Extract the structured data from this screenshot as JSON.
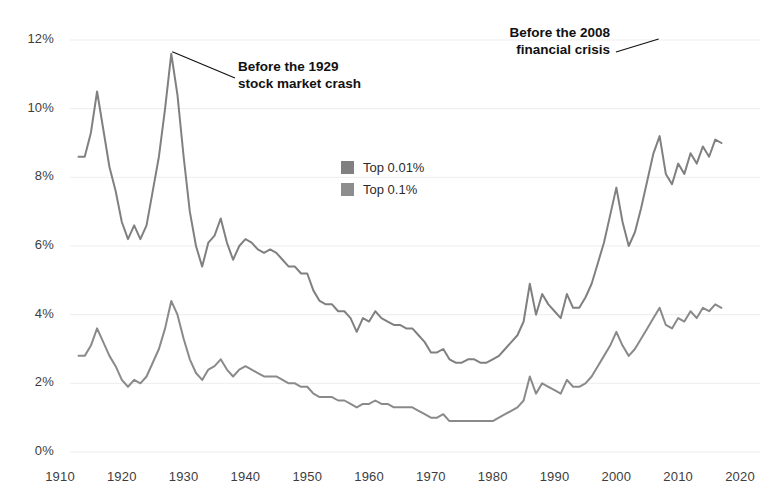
{
  "chart_data": {
    "type": "line",
    "title": "",
    "subtitle": "",
    "xlabel": "",
    "ylabel": "",
    "xlim": [
      1910,
      2020
    ],
    "ylim": [
      0,
      12
    ],
    "grid": true,
    "y_tick_labels": [
      "0%",
      "2%",
      "4%",
      "6%",
      "8%",
      "10%",
      "12%"
    ],
    "y_tick_values": [
      0,
      2,
      4,
      6,
      8,
      10,
      12
    ],
    "x_tick_labels": [
      "1910",
      "1920",
      "1930",
      "1940",
      "1950",
      "1960",
      "1970",
      "1980",
      "1990",
      "2000",
      "2010",
      "2020"
    ],
    "x_tick_values": [
      1910,
      1920,
      1930,
      1940,
      1950,
      1960,
      1970,
      1980,
      1990,
      2000,
      2010,
      2020
    ],
    "legend_position": "center",
    "legend": [
      "Top 0.01%",
      "Top 0.1%"
    ],
    "series": [
      {
        "name": "Top 0.01%",
        "color": "#808080",
        "x": [
          1913,
          1914,
          1915,
          1916,
          1917,
          1918,
          1919,
          1920,
          1921,
          1922,
          1923,
          1924,
          1925,
          1926,
          1927,
          1928,
          1929,
          1930,
          1931,
          1932,
          1933,
          1934,
          1935,
          1936,
          1937,
          1938,
          1939,
          1940,
          1941,
          1942,
          1943,
          1944,
          1945,
          1946,
          1947,
          1948,
          1949,
          1950,
          1951,
          1952,
          1953,
          1954,
          1955,
          1956,
          1957,
          1958,
          1959,
          1960,
          1961,
          1962,
          1963,
          1964,
          1965,
          1966,
          1967,
          1968,
          1969,
          1970,
          1971,
          1972,
          1973,
          1974,
          1975,
          1976,
          1977,
          1978,
          1979,
          1980,
          1981,
          1982,
          1983,
          1984,
          1985,
          1986,
          1987,
          1988,
          1989,
          1990,
          1991,
          1992,
          1993,
          1994,
          1995,
          1996,
          1997,
          1998,
          1999,
          2000,
          2001,
          2002,
          2003,
          2004,
          2005,
          2006,
          2007,
          2008,
          2009,
          2010,
          2011,
          2012,
          2013,
          2014,
          2015,
          2016,
          2017
        ],
        "values": [
          8.6,
          8.6,
          9.3,
          10.5,
          9.4,
          8.3,
          7.6,
          6.7,
          6.2,
          6.6,
          6.2,
          6.6,
          7.6,
          8.6,
          10.0,
          11.6,
          10.4,
          8.6,
          7.0,
          6.0,
          5.4,
          6.1,
          6.3,
          6.8,
          6.1,
          5.6,
          6.0,
          6.2,
          6.1,
          5.9,
          5.8,
          5.9,
          5.8,
          5.6,
          5.4,
          5.4,
          5.2,
          5.2,
          4.7,
          4.4,
          4.3,
          4.3,
          4.1,
          4.1,
          3.9,
          3.5,
          3.9,
          3.8,
          4.1,
          3.9,
          3.8,
          3.7,
          3.7,
          3.6,
          3.6,
          3.4,
          3.2,
          2.9,
          2.9,
          3.0,
          2.7,
          2.6,
          2.6,
          2.7,
          2.7,
          2.6,
          2.6,
          2.7,
          2.8,
          3.0,
          3.2,
          3.4,
          3.8,
          4.9,
          4.0,
          4.6,
          4.3,
          4.1,
          3.9,
          4.6,
          4.2,
          4.2,
          4.5,
          4.9,
          5.5,
          6.1,
          6.9,
          7.7,
          6.7,
          6.0,
          6.4,
          7.1,
          7.9,
          8.7,
          9.2,
          8.1,
          7.8,
          8.4,
          8.1,
          8.7,
          8.4,
          8.9,
          8.6,
          9.1,
          9.0
        ],
        "annotated_peaks": [
          {
            "year": 1916,
            "value": 10.5
          },
          {
            "year": 1928,
            "value": 11.6,
            "label": "Before the 1929 stock market crash"
          },
          {
            "year": 1986,
            "value": 4.9
          },
          {
            "year": 2000,
            "value": 7.7
          },
          {
            "year": 2007,
            "value": 9.2,
            "label": "Before the 2008 financial crisis"
          }
        ]
      },
      {
        "name": "Top 0.1%",
        "color": "#8a8a8a",
        "x": [
          1913,
          1914,
          1915,
          1916,
          1917,
          1918,
          1919,
          1920,
          1921,
          1922,
          1923,
          1924,
          1925,
          1926,
          1927,
          1928,
          1929,
          1930,
          1931,
          1932,
          1933,
          1934,
          1935,
          1936,
          1937,
          1938,
          1939,
          1940,
          1941,
          1942,
          1943,
          1944,
          1945,
          1946,
          1947,
          1948,
          1949,
          1950,
          1951,
          1952,
          1953,
          1954,
          1955,
          1956,
          1957,
          1958,
          1959,
          1960,
          1961,
          1962,
          1963,
          1964,
          1965,
          1966,
          1967,
          1968,
          1969,
          1970,
          1971,
          1972,
          1973,
          1974,
          1975,
          1976,
          1977,
          1978,
          1979,
          1980,
          1981,
          1982,
          1983,
          1984,
          1985,
          1986,
          1987,
          1988,
          1989,
          1990,
          1991,
          1992,
          1993,
          1994,
          1995,
          1996,
          1997,
          1998,
          1999,
          2000,
          2001,
          2002,
          2003,
          2004,
          2005,
          2006,
          2007,
          2008,
          2009,
          2010,
          2011,
          2012,
          2013,
          2014,
          2015,
          2016,
          2017
        ],
        "values": [
          2.8,
          2.8,
          3.1,
          3.6,
          3.2,
          2.8,
          2.5,
          2.1,
          1.9,
          2.1,
          2.0,
          2.2,
          2.6,
          3.0,
          3.6,
          4.4,
          4.0,
          3.3,
          2.7,
          2.3,
          2.1,
          2.4,
          2.5,
          2.7,
          2.4,
          2.2,
          2.4,
          2.5,
          2.4,
          2.3,
          2.2,
          2.2,
          2.2,
          2.1,
          2.0,
          2.0,
          1.9,
          1.9,
          1.7,
          1.6,
          1.6,
          1.6,
          1.5,
          1.5,
          1.4,
          1.3,
          1.4,
          1.4,
          1.5,
          1.4,
          1.4,
          1.3,
          1.3,
          1.3,
          1.3,
          1.2,
          1.1,
          1.0,
          1.0,
          1.1,
          0.9,
          0.9,
          0.9,
          0.9,
          0.9,
          0.9,
          0.9,
          0.9,
          1.0,
          1.1,
          1.2,
          1.3,
          1.5,
          2.2,
          1.7,
          2.0,
          1.9,
          1.8,
          1.7,
          2.1,
          1.9,
          1.9,
          2.0,
          2.2,
          2.5,
          2.8,
          3.1,
          3.5,
          3.1,
          2.8,
          3.0,
          3.3,
          3.6,
          3.9,
          4.2,
          3.7,
          3.6,
          3.9,
          3.8,
          4.1,
          3.9,
          4.2,
          4.1,
          4.3,
          4.2
        ],
        "annotated_peaks": [
          {
            "year": 1916,
            "value": 3.6
          },
          {
            "year": 1928,
            "value": 4.4
          },
          {
            "year": 2007,
            "value": 4.2
          }
        ]
      }
    ],
    "annotations": [
      {
        "id": "annotation-1929",
        "text": "Before the 1929\nstock market crash",
        "target_year": 1928,
        "target_value": 11.6
      },
      {
        "id": "annotation-2008",
        "text": "Before the 2008\nfinancial crisis",
        "target_year": 2007,
        "target_value": 12.0
      }
    ]
  },
  "legend": {
    "items": [
      {
        "label": "Top 0.01%",
        "color": "#808080"
      },
      {
        "label": "Top 0.1%",
        "color": "#8d8d8d"
      }
    ]
  },
  "annotation_1929": "Before the 1929\nstock market crash",
  "annotation_2008": "Before the 2008\nfinancial crisis"
}
